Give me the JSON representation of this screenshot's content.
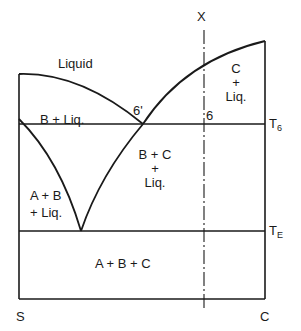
{
  "diagram": {
    "type": "ternary-section phase diagram",
    "axis": {
      "left_label": "S",
      "right_label": "C",
      "composition_marker": "X",
      "temp_labels": {
        "t6": "T",
        "t6_sub": "6",
        "te": "T",
        "te_sub": "E"
      }
    },
    "regions": {
      "liquid": "Liquid",
      "b_liq": "B + Liq.",
      "c_liq_line1": "C",
      "c_liq_line2": "+",
      "c_liq_line3": "Liq.",
      "bc_liq_line1": "B + C",
      "bc_liq_line2": "+",
      "bc_liq_line3": "Liq.",
      "ab_liq_line1": "A + B",
      "ab_liq_line2": "+ Liq.",
      "abc": "A + B + C"
    },
    "points": {
      "six_prime": "6'",
      "six": "6"
    },
    "colors": {
      "line": "#1a1a1a",
      "background": "#ffffff"
    }
  }
}
